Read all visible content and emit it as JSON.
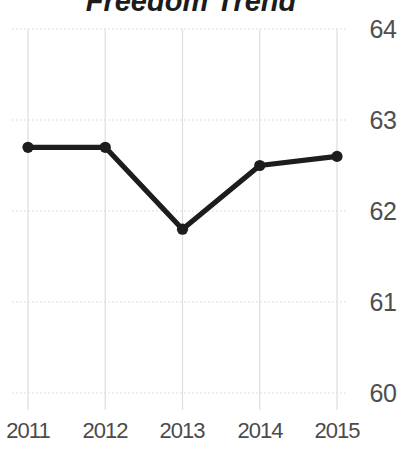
{
  "chart_data": {
    "type": "line",
    "title": "Freedom Trend",
    "x": [
      2011,
      2012,
      2013,
      2014,
      2015
    ],
    "values": [
      62.7,
      62.7,
      61.8,
      62.5,
      62.6
    ],
    "x_ticks": [
      "2011",
      "2012",
      "2013",
      "2014",
      "2015"
    ],
    "y_ticks": [
      "64",
      "63",
      "62",
      "61",
      "60"
    ],
    "ylim": [
      60,
      64
    ],
    "xlabel": "",
    "ylabel": "",
    "legend": "none",
    "grid": "on",
    "y_axis_side": "right",
    "line_color": "#1d1d1d",
    "point_color": "#1d1d1d",
    "grid_color_vertical": "#dedede",
    "grid_color_horizontal": "#d7d7d7",
    "label_color": "#4b4b4b",
    "title_color": "#1c1c1c"
  }
}
